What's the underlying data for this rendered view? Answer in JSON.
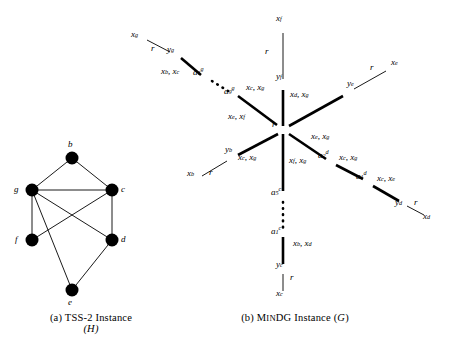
{
  "figure": {
    "panel_a": {
      "caption_line1": "(a) TSS-2 Instance",
      "caption_line2": "(H)",
      "graph_name": "H",
      "nodes": [
        {
          "id": "b",
          "label": "b",
          "x": 72,
          "y": 158,
          "label_x": 72,
          "label_y": 146
        },
        {
          "id": "g",
          "label": "g",
          "x": 32,
          "y": 190,
          "label_x": 20,
          "label_y": 193
        },
        {
          "id": "c",
          "label": "c",
          "x": 112,
          "y": 190,
          "label_x": 124,
          "label_y": 193
        },
        {
          "id": "f",
          "label": "f",
          "x": 32,
          "y": 240,
          "label_x": 20,
          "label_y": 243
        },
        {
          "id": "d",
          "label": "d",
          "x": 112,
          "y": 240,
          "label_x": 124,
          "label_y": 243
        },
        {
          "id": "e",
          "label": "e",
          "x": 72,
          "y": 290,
          "label_x": 72,
          "label_y": 305
        }
      ],
      "edges": [
        [
          "b",
          "g"
        ],
        [
          "b",
          "c"
        ],
        [
          "g",
          "c"
        ],
        [
          "g",
          "f"
        ],
        [
          "g",
          "d"
        ],
        [
          "g",
          "e"
        ],
        [
          "c",
          "f"
        ],
        [
          "c",
          "d"
        ],
        [
          "d",
          "e"
        ]
      ]
    },
    "panel_b": {
      "caption_prefix": "(b) ",
      "caption_smallcaps_big": "M",
      "caption_smallcaps_small": "IN",
      "caption_smallcaps_rest": "DG",
      "caption_suffix": " Instance (G)",
      "graph_name": "G",
      "hub": {
        "label": "r",
        "x": 283,
        "y": 130
      },
      "branches": [
        {
          "name": "branch-f-top",
          "thick_edge_label": "",
          "nodes": [
            {
              "id": "yf",
              "base": "y",
              "sub": "f",
              "x": 283,
              "y": 86,
              "label_x": 283,
              "label_y": 78
            },
            {
              "id": "xf",
              "base": "x",
              "sub": "f",
              "x": 283,
              "y": 26,
              "label_x": 283,
              "label_y": 20
            }
          ],
          "thin_edge_label": "r",
          "thin_label_x": 272,
          "thin_label_y": 53
        },
        {
          "name": "branch-g-upper-left",
          "thick_edge_label": "x_b, x_c",
          "nodes": [
            {
              "id": "a1g",
              "base": "a",
              "sub": "1",
              "sup": "g",
              "x": 206,
              "y": 78,
              "label_x": 198,
              "label_y": 74
            },
            {
              "id": "a9g",
              "base": "a",
              "sup": "g",
              "sub": "9",
              "x": 232,
              "y": 92,
              "label_x": 228,
              "label_y": 92
            },
            {
              "id": "yg",
              "base": "y",
              "sub": "g",
              "x": 176,
              "y": 55,
              "label_x": 176,
              "label_y": 50
            },
            {
              "id": "xg",
              "base": "x",
              "sub": "g",
              "x": 140,
              "y": 36,
              "label_x": 140,
              "label_y": 34
            }
          ]
        },
        {
          "name": "branch-e-upper-right",
          "nodes": [
            {
              "id": "ye",
              "base": "y",
              "sub": "e",
              "x": 348,
              "y": 92,
              "label_x": 352,
              "label_y": 90
            },
            {
              "id": "xe",
              "base": "x",
              "sub": "e",
              "x": 392,
              "y": 68,
              "label_x": 396,
              "label_y": 66
            }
          ]
        },
        {
          "name": "branch-d-lower-right",
          "nodes": [
            {
              "id": "a2d",
              "base": "a",
              "sub": "2",
              "sup": "d",
              "x": 330,
              "y": 162
            },
            {
              "id": "a1d",
              "base": "a",
              "sub": "1",
              "sup": "d",
              "x": 368,
              "y": 182
            },
            {
              "id": "yd",
              "base": "y",
              "sub": "d",
              "x": 402,
              "y": 203
            },
            {
              "id": "xd",
              "base": "x",
              "sub": "d",
              "x": 430,
              "y": 218
            }
          ]
        },
        {
          "name": "branch-b-lower-left",
          "nodes": [
            {
              "id": "yb",
              "base": "y",
              "sub": "b",
              "x": 233,
              "y": 158,
              "label_x": 228,
              "label_y": 152
            },
            {
              "id": "xb",
              "base": "x",
              "sub": "b",
              "x": 196,
              "y": 178,
              "label_x": 192,
              "label_y": 178
            }
          ]
        },
        {
          "name": "branch-c-bottom",
          "nodes": [
            {
              "id": "a5c",
              "base": "a",
              "sub": "5",
              "sup": "c",
              "x": 283,
              "y": 195
            },
            {
              "id": "a1c",
              "base": "a",
              "sub": "1",
              "sup": "c",
              "x": 283,
              "y": 233
            },
            {
              "id": "yc",
              "base": "y",
              "sub": "c",
              "x": 283,
              "y": 268
            },
            {
              "id": "xc",
              "base": "x",
              "sub": "c",
              "x": 283,
              "y": 297
            }
          ]
        }
      ],
      "edge_labels": [
        {
          "id": "lbl-xf-r",
          "text": "r",
          "x": 272,
          "y": 53,
          "italic": true
        },
        {
          "id": "lbl-xg-r",
          "text": "r",
          "x": 158,
          "y": 48,
          "italic": true
        },
        {
          "id": "lbl-xb-r",
          "text": "r",
          "x": 214,
          "y": 173,
          "italic": true
        },
        {
          "id": "lbl-xe-r",
          "text": "r",
          "x": 372,
          "y": 72,
          "italic": true
        },
        {
          "id": "lbl-xd-r",
          "text": "r",
          "x": 418,
          "y": 205,
          "italic": true
        },
        {
          "id": "lbl-xc-r",
          "text": "r",
          "x": 274,
          "y": 283,
          "italic": true
        },
        {
          "id": "lbl-yg-a1g",
          "text": "x_b, x_c",
          "x": 186,
          "y": 76
        },
        {
          "id": "lbl-a9g-r",
          "text": "x_c, x_g",
          "x": 253,
          "y": 91
        },
        {
          "id": "lbl-a9g-r2",
          "text": "x_e, x_f",
          "x": 240,
          "y": 119
        },
        {
          "id": "lbl-yf-r",
          "text": "x_d, x_g",
          "x": 305,
          "y": 100
        },
        {
          "id": "lbl-ye-r",
          "text": "x_e, x_g",
          "x": 318,
          "y": 143
        },
        {
          "id": "lbl-yb-r",
          "text": "x_c, x_g",
          "x": 250,
          "y": 160
        },
        {
          "id": "lbl-a5c-r",
          "text": "x_f, x_g",
          "x": 300,
          "y": 163
        },
        {
          "id": "lbl-a2d",
          "text": "x_c, x_g",
          "x": 350,
          "y": 163
        },
        {
          "id": "lbl-a1d",
          "text": "x_c, x_e",
          "x": 388,
          "y": 183
        },
        {
          "id": "lbl-a1c-yc",
          "text": "x_b, x_d",
          "x": 300,
          "y": 247
        }
      ]
    }
  }
}
